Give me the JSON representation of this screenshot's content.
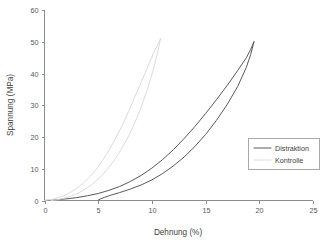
{
  "chart_data": {
    "type": "line",
    "title": "",
    "subtitle": "",
    "xlabel": "Dehnung (%)",
    "ylabel": "Spannung (MPa)",
    "xlim": [
      0,
      25
    ],
    "ylim": [
      0,
      60
    ],
    "xticks": [
      0,
      5,
      10,
      15,
      20,
      25
    ],
    "yticks": [
      0,
      10,
      20,
      30,
      40,
      50,
      60
    ],
    "xtick_labels": [
      "0",
      "5",
      "10",
      "15",
      "20",
      "25"
    ],
    "ytick_labels": [
      "0",
      "10",
      "20",
      "30",
      "40",
      "50",
      "60"
    ],
    "grid": false,
    "frame": "left-bottom",
    "legend_position": "center-right",
    "annotations": [],
    "series": [
      {
        "name": "Distraktion",
        "color": "#595959",
        "linestyle": "solid",
        "linewidth": 1.0,
        "curve_kind": "hysteresis-loop",
        "peak": {
          "x": 19.5,
          "y": 50.0
        },
        "loading": {
          "x": [
            0.0,
            1.0,
            2.0,
            3.0,
            4.0,
            5.0,
            6.0,
            7.0,
            8.0,
            9.0,
            10.0,
            11.0,
            12.0,
            13.0,
            14.0,
            15.0,
            16.0,
            17.0,
            18.0,
            18.8,
            19.2,
            19.5
          ],
          "y": [
            0.0,
            0.2,
            0.5,
            0.9,
            1.5,
            2.2,
            3.2,
            4.4,
            6.0,
            7.9,
            10.2,
            12.9,
            16.0,
            19.5,
            23.3,
            27.4,
            31.7,
            36.2,
            41.0,
            45.0,
            47.6,
            50.0
          ]
        },
        "unloading": {
          "x": [
            19.5,
            19.2,
            18.8,
            18.0,
            17.0,
            16.0,
            15.0,
            14.0,
            13.0,
            12.0,
            11.0,
            10.0,
            9.0,
            8.0,
            7.0,
            6.2,
            5.6,
            5.2,
            5.0
          ],
          "y": [
            50.0,
            46.0,
            42.0,
            36.0,
            30.2,
            25.2,
            20.8,
            17.0,
            13.7,
            10.9,
            8.5,
            6.5,
            4.9,
            3.6,
            2.5,
            1.7,
            1.0,
            0.5,
            0.1
          ]
        }
      },
      {
        "name": "Kontrolle",
        "color": "#dcdcdc",
        "linestyle": "solid",
        "linewidth": 1.0,
        "curve_kind": "hysteresis-loop",
        "peak": {
          "x": 10.8,
          "y": 51.0
        },
        "loading": {
          "x": [
            0.0,
            0.6,
            1.2,
            1.8,
            2.4,
            3.0,
            3.6,
            4.2,
            4.8,
            5.4,
            6.0,
            6.6,
            7.2,
            7.8,
            8.4,
            9.0,
            9.6,
            10.2,
            10.6,
            10.8
          ],
          "y": [
            0.0,
            0.3,
            0.8,
            1.5,
            2.5,
            3.8,
            5.4,
            7.4,
            9.8,
            12.6,
            15.8,
            19.4,
            23.4,
            27.8,
            32.6,
            37.2,
            42.0,
            46.8,
            49.5,
            51.0
          ]
        },
        "unloading": {
          "x": [
            10.8,
            10.6,
            10.2,
            9.6,
            9.0,
            8.4,
            7.8,
            7.2,
            6.6,
            6.0,
            5.4,
            4.8,
            4.2,
            3.6,
            3.0,
            2.4,
            1.8,
            1.3,
            0.9,
            0.6
          ],
          "y": [
            51.0,
            47.5,
            42.0,
            35.2,
            29.4,
            24.4,
            20.1,
            16.4,
            13.2,
            10.5,
            8.1,
            6.1,
            4.5,
            3.2,
            2.1,
            1.3,
            0.7,
            0.3,
            0.1,
            0.0
          ]
        }
      }
    ]
  },
  "legend": {
    "entries": [
      {
        "label": "Distraktion"
      },
      {
        "label": "Kontrolle"
      }
    ]
  }
}
